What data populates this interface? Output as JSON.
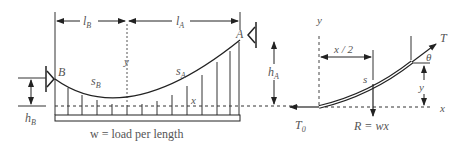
{
  "diagram": {
    "left_figure": {
      "labels": {
        "lB": "l",
        "lB_sub": "B",
        "lA": "l",
        "lA_sub": "A",
        "y_axis": "y",
        "x_axis": "x",
        "point_A": "A",
        "point_B": "B",
        "sA": "s",
        "sA_sub": "A",
        "sB": "s",
        "sB_sub": "B",
        "hA": "h",
        "hA_sub": "A",
        "hB": "h",
        "hB_sub": "B",
        "load_caption": "w = load per length"
      }
    },
    "right_figure": {
      "labels": {
        "y_axis": "y",
        "x_axis": "x",
        "half_x": "x / 2",
        "s": "s",
        "T": "T",
        "theta": "θ",
        "y_height": "y",
        "T0": "T",
        "T0_sub": "0",
        "resultant": "R = wx"
      }
    },
    "colors": {
      "line": "#333333",
      "text": "#555555",
      "background": "#ffffff"
    }
  }
}
